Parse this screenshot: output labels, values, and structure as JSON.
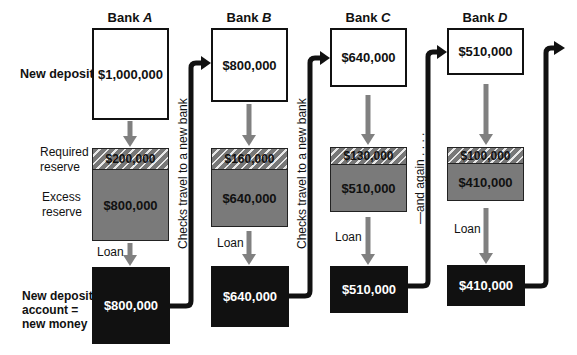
{
  "row_labels": {
    "new_deposits": "New deposits",
    "required_reserve": [
      "Required",
      "reserve"
    ],
    "excess_reserve": [
      "Excess",
      "reserve"
    ],
    "new_money": [
      "New deposit",
      "account =",
      "new money"
    ]
  },
  "banks": [
    {
      "name_prefix": "Bank ",
      "name_letter": "A",
      "deposit": "$1,000,000",
      "required_reserve": "$200,000",
      "excess_reserve": "$800,000",
      "loan_label": "Loan",
      "new_money": "$800,000"
    },
    {
      "name_prefix": "Bank ",
      "name_letter": "B",
      "deposit": "$800,000",
      "required_reserve": "$160,000",
      "excess_reserve": "$640,000",
      "loan_label": "Loan",
      "new_money": "$640,000"
    },
    {
      "name_prefix": "Bank ",
      "name_letter": "C",
      "deposit": "$640,000",
      "required_reserve": "$130,000",
      "excess_reserve": "$510,000",
      "loan_label": "Loan",
      "new_money": "$510,000"
    },
    {
      "name_prefix": "Bank ",
      "name_letter": "D",
      "deposit": "$510,000",
      "required_reserve": "$100,000",
      "excess_reserve": "$410,000",
      "loan_label": "Loan",
      "new_money": "$410,000"
    }
  ],
  "connectors": {
    "ab": "Checks travel to a new bank",
    "bc": "Checks travel to a new bank",
    "cd": "—and again . . . ."
  },
  "colors": {
    "excess_gray": "#7a7a7a",
    "loan_arrow": "#808080",
    "money_black": "#111111"
  }
}
